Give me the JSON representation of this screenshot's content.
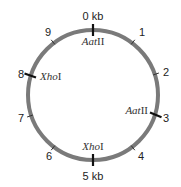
{
  "diagram": {
    "type": "circular-restriction-map",
    "ring_color": "#7a7a7a",
    "tick_color": "#222222",
    "total_kb": 10,
    "position_labels": [
      {
        "pos": 0,
        "label": "0 kb"
      },
      {
        "pos": 1,
        "label": "1"
      },
      {
        "pos": 2,
        "label": "2"
      },
      {
        "pos": 3,
        "label": "3"
      },
      {
        "pos": 4,
        "label": "4"
      },
      {
        "pos": 5,
        "label": "5 kb"
      },
      {
        "pos": 6,
        "label": "6"
      },
      {
        "pos": 7,
        "label": "7"
      },
      {
        "pos": 8,
        "label": "8"
      },
      {
        "pos": 9,
        "label": "9"
      }
    ],
    "sites": [
      {
        "enzyme_italic": "Aat",
        "enzyme_roman": "II",
        "pos": 0
      },
      {
        "enzyme_italic": "Aat",
        "enzyme_roman": "II",
        "pos": 3
      },
      {
        "enzyme_italic": "Xho",
        "enzyme_roman": "I",
        "pos": 5
      },
      {
        "enzyme_italic": "Xho",
        "enzyme_roman": "I",
        "pos": 8
      }
    ]
  }
}
